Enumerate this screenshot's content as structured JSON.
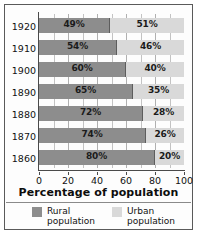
{
  "chart_data": {
    "type": "bar",
    "orientation": "horizontal",
    "stacked": true,
    "title": "",
    "xlabel": "Percentage of population",
    "ylabel": "",
    "xlim": [
      0,
      100
    ],
    "xticks": [
      0,
      20,
      40,
      60,
      80,
      100
    ],
    "xtick_labels": [
      "0",
      "20",
      "40",
      "60",
      "80",
      "100"
    ],
    "grid": "vertical gridlines every 10 percent",
    "legend_position": "bottom",
    "categories": [
      "1920",
      "1910",
      "1900",
      "1890",
      "1880",
      "1870",
      "1860"
    ],
    "series": [
      {
        "name": "Rural population",
        "color": "#8d8d8d",
        "values": [
          49,
          54,
          60,
          65,
          72,
          74,
          80
        ],
        "labels": [
          "49%",
          "54%",
          "60%",
          "65%",
          "72%",
          "74%",
          "80%"
        ]
      },
      {
        "name": "Urban population",
        "color": "#d9d9d9",
        "values": [
          51,
          46,
          40,
          35,
          28,
          26,
          20
        ],
        "labels": [
          "51%",
          "46%",
          "40%",
          "35%",
          "28%",
          "26%",
          "20%"
        ]
      }
    ]
  },
  "legend": {
    "items": [
      {
        "key": "rural",
        "line1": "Rural",
        "line2": "population",
        "color": "#8d8d8d"
      },
      {
        "key": "urban",
        "line1": "Urban",
        "line2": "population",
        "color": "#d9d9d9"
      }
    ]
  },
  "axis": {
    "x_title": "Percentage of population"
  }
}
